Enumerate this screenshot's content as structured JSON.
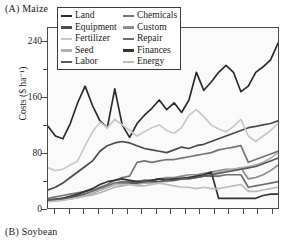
{
  "panels": {
    "a": "(A)  Maize",
    "b": "(B)  Soybean"
  },
  "axes": {
    "ylabel": "Costs ($ ha⁻¹)",
    "yticks": [
      "240",
      "160",
      "80",
      "0"
    ],
    "ytick_values": [
      240,
      160,
      80,
      0
    ],
    "ylim": [
      0,
      260
    ],
    "n_xticks": 16,
    "grid": false
  },
  "legend": {
    "position": "top-inside",
    "columns": 2,
    "entries": [
      {
        "label": "Land",
        "color": "#2b2b2b"
      },
      {
        "label": "Chemicals",
        "color": "#757575"
      },
      {
        "label": "Equipment",
        "color": "#4a4a4a"
      },
      {
        "label": "Custom",
        "color": "#8c8c8c"
      },
      {
        "label": "Fertilizer",
        "color": "#c9c9c9"
      },
      {
        "label": "Repair",
        "color": "#6e6e6e"
      },
      {
        "label": "Seed",
        "color": "#b0b0b0"
      },
      {
        "label": "Finances",
        "color": "#333333"
      },
      {
        "label": "Labor",
        "color": "#595959"
      },
      {
        "label": "Energy",
        "color": "#bdbdbd"
      }
    ]
  },
  "chart_data": {
    "type": "line",
    "title": "(A)  Maize",
    "xlabel": "",
    "ylabel": "Costs ($ ha⁻¹)",
    "ylim": [
      0,
      260
    ],
    "grid": false,
    "legend_position": "top-inside",
    "x": [
      1,
      2,
      3,
      4,
      5,
      6,
      7,
      8,
      9,
      10,
      11,
      12,
      13,
      14,
      15,
      16,
      17,
      18,
      19,
      20,
      21,
      22,
      23,
      24,
      25,
      26,
      27,
      28,
      29,
      30,
      31,
      32
    ],
    "series": [
      {
        "name": "Land",
        "color": "#2b2b2b",
        "values": [
          118,
          104,
          100,
          122,
          152,
          176,
          148,
          126,
          116,
          172,
          120,
          102,
          122,
          134,
          144,
          156,
          142,
          152,
          138,
          156,
          196,
          170,
          182,
          196,
          206,
          196,
          168,
          176,
          196,
          204,
          214,
          238
        ]
      },
      {
        "name": "Equipment",
        "color": "#4a4a4a",
        "values": [
          26,
          30,
          36,
          44,
          52,
          60,
          68,
          82,
          90,
          94,
          96,
          94,
          90,
          86,
          84,
          82,
          80,
          84,
          88,
          86,
          90,
          92,
          96,
          100,
          104,
          108,
          112,
          116,
          118,
          120,
          122,
          126
        ]
      },
      {
        "name": "Chemicals",
        "color": "#757575",
        "values": [
          14,
          16,
          18,
          20,
          22,
          24,
          26,
          30,
          34,
          40,
          44,
          46,
          66,
          68,
          66,
          68,
          70,
          70,
          72,
          74,
          76,
          78,
          80,
          84,
          86,
          88,
          90,
          66,
          70,
          74,
          78,
          82
        ]
      },
      {
        "name": "Fertilizer",
        "color": "#c9c9c9",
        "values": [
          58,
          54,
          56,
          62,
          68,
          90,
          110,
          124,
          116,
          128,
          120,
          112,
          104,
          110,
          116,
          120,
          112,
          108,
          116,
          134,
          142,
          132,
          120,
          114,
          110,
          118,
          128,
          104,
          96,
          104,
          112,
          122
        ]
      },
      {
        "name": "Custom",
        "color": "#8c8c8c",
        "values": [
          12,
          13,
          14,
          16,
          18,
          20,
          22,
          26,
          30,
          34,
          34,
          36,
          38,
          40,
          40,
          42,
          44,
          44,
          46,
          48,
          48,
          50,
          52,
          54,
          56,
          56,
          58,
          42,
          44,
          48,
          54,
          62
        ]
      },
      {
        "name": "Seed",
        "color": "#b0b0b0",
        "values": [
          10,
          11,
          12,
          13,
          15,
          17,
          19,
          22,
          26,
          30,
          32,
          34,
          34,
          36,
          36,
          38,
          38,
          40,
          42,
          44,
          46,
          48,
          50,
          52,
          54,
          56,
          58,
          60,
          62,
          66,
          72,
          80
        ]
      },
      {
        "name": "Repair",
        "color": "#6e6e6e",
        "values": [
          12,
          13,
          14,
          16,
          18,
          21,
          24,
          28,
          32,
          36,
          38,
          38,
          38,
          40,
          40,
          42,
          42,
          42,
          44,
          44,
          44,
          46,
          46,
          46,
          48,
          48,
          48,
          30,
          32,
          34,
          36,
          38
        ]
      },
      {
        "name": "Finances",
        "color": "#333333",
        "values": [
          10,
          12,
          14,
          17,
          20,
          24,
          28,
          34,
          38,
          40,
          42,
          40,
          38,
          38,
          40,
          42,
          40,
          42,
          42,
          44,
          46,
          48,
          52,
          14,
          14,
          14,
          14,
          14,
          14,
          18,
          20,
          20
        ]
      },
      {
        "name": "Labor",
        "color": "#595959",
        "values": [
          11,
          12,
          13,
          15,
          17,
          19,
          22,
          26,
          30,
          34,
          36,
          36,
          36,
          38,
          38,
          38,
          40,
          40,
          42,
          42,
          44,
          46,
          48,
          50,
          52,
          54,
          56,
          58,
          60,
          64,
          68,
          72
        ]
      },
      {
        "name": "Energy",
        "color": "#bdbdbd",
        "values": [
          9,
          10,
          11,
          13,
          15,
          18,
          22,
          26,
          30,
          34,
          34,
          34,
          32,
          32,
          34,
          36,
          34,
          32,
          30,
          30,
          28,
          30,
          28,
          28,
          30,
          32,
          34,
          24,
          24,
          26,
          28,
          30
        ]
      }
    ]
  }
}
